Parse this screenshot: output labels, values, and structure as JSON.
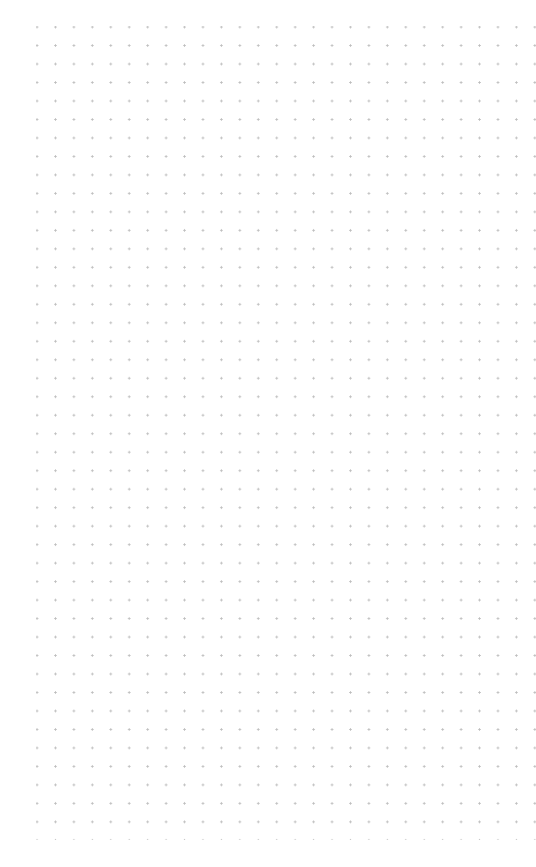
{
  "canvas": {
    "type": "dot-grid",
    "background": "#ffffff",
    "dot_color": "#bdbdbd",
    "columns": 27,
    "rows": 44,
    "spacing_px": 18.5
  }
}
